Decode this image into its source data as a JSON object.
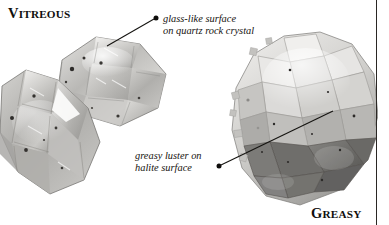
{
  "figure": {
    "type": "mineral-luster-comparison",
    "background_color": "#ffffff",
    "text_color": "#16130f",
    "rule_color": "#2a2724",
    "width": 389,
    "height": 225
  },
  "labels": {
    "vitreous": {
      "first": "V",
      "rest": "ITREOUS"
    },
    "greasy": {
      "first": "G",
      "rest": "REASY"
    }
  },
  "annotations": [
    {
      "name": "glass-like-surface",
      "line1": "glass-like surface",
      "line2": "on quartz rock crystal",
      "dot": {
        "x": 157,
        "y": 18
      },
      "leader_end": {
        "x": 107,
        "y": 46
      }
    },
    {
      "name": "greasy-luster",
      "line1": "greasy luster on",
      "line2": "halite surface",
      "dot": {
        "x": 219,
        "y": 166
      },
      "leader_end": {
        "x": 333,
        "y": 111
      }
    }
  ],
  "specimens": [
    {
      "name": "quartz-rock-crystal",
      "luster": "Vitreous",
      "description": "clear grey quartz crystal cluster, glassy reflective faces"
    },
    {
      "name": "halite-mass",
      "luster": "Greasy",
      "description": "pale grey cubic halite crystal aggregate with dull greasy faces"
    }
  ]
}
